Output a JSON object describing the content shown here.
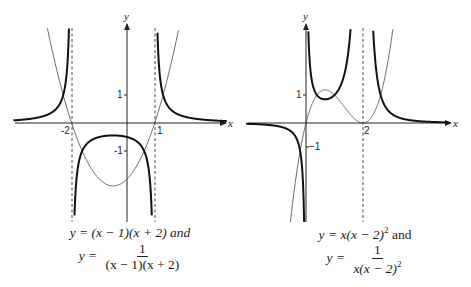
{
  "chart_data": [
    {
      "type": "line",
      "title": "",
      "caption_line1": "y = (x − 1)(x + 2) and",
      "caption_lhs": "y =",
      "caption_num": "1",
      "caption_den": "(x − 1)(x + 2)",
      "xlabel": "x",
      "ylabel": "y",
      "xlim": [
        -4.1,
        3.9
      ],
      "ylim": [
        -3.5,
        3.3
      ],
      "grid": false,
      "x_ticks": [
        "-2",
        "1"
      ],
      "y_ticks": [
        "1",
        "-1"
      ],
      "vertical_asymptotes": [
        -2,
        1
      ],
      "series": [
        {
          "name": "y = (x-1)(x+2)",
          "style": "thin",
          "expression": "(x-1)*(x+2)"
        },
        {
          "name": "y = 1/((x-1)(x+2))",
          "style": "thick",
          "expression": "1/((x-1)*(x+2))"
        }
      ],
      "annotations": {
        "minimum_parabola": [
          -0.5,
          -2.25
        ],
        "maximum_reciprocal": [
          -0.5,
          -0.444
        ]
      }
    },
    {
      "type": "line",
      "title": "",
      "caption_line1": "y = x(x − 2)² and",
      "caption_lhs": "y =",
      "caption_num": "1",
      "caption_den": "x(x − 2)²",
      "xlabel": "x",
      "ylabel": "y",
      "xlim": [
        -2.9,
        3.6
      ],
      "ylim": [
        -4.0,
        3.3
      ],
      "grid": false,
      "x_ticks": [
        "2"
      ],
      "y_ticks": [
        "1",
        "-1"
      ],
      "vertical_asymptotes": [
        0,
        2
      ],
      "series": [
        {
          "name": "y = x(x-2)^2",
          "style": "thin",
          "expression": "x*(x-2)^2"
        },
        {
          "name": "y = 1/(x(x-2)^2)",
          "style": "thick",
          "expression": "1/(x*(x-2)^2)"
        }
      ],
      "annotations": {
        "local_max_cubic": [
          0.667,
          1.185
        ],
        "local_min_reciprocal": [
          0.667,
          0.844
        ]
      }
    }
  ],
  "left": {
    "x_label": "x",
    "y_label": "y",
    "tick_neg2": "-2",
    "tick_1": "1",
    "tick_y1": "1",
    "tick_yneg1": "-1",
    "caption": {
      "line1": "y = (x − 1)(x + 2) and",
      "lhs": "y =",
      "num": "1",
      "den": "(x − 1)(x + 2)"
    }
  },
  "right": {
    "x_label": "x",
    "y_label": "y",
    "tick_2": "2",
    "tick_y1": "1",
    "tick_yneg1": "−1",
    "caption": {
      "line1a": "y = x(x − 2)",
      "line1sup": "2",
      "line1b": " and",
      "lhs": "y =",
      "num": "1",
      "den": "x(x − 2)",
      "densup": "2"
    }
  }
}
